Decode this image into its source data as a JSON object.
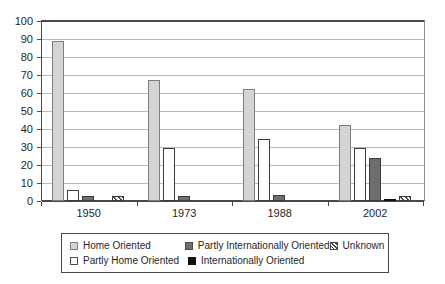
{
  "chart_data": {
    "type": "bar",
    "title": "",
    "subtitle": "",
    "xlabel": "",
    "ylabel": "",
    "categories": [
      "1950",
      "1973",
      "1988",
      "2002"
    ],
    "ylim": [
      0,
      100
    ],
    "y_ticks": [
      0,
      10,
      20,
      30,
      40,
      50,
      60,
      70,
      80,
      90,
      100
    ],
    "grid": true,
    "legend_position": "bottom",
    "series": [
      {
        "name": "Home Oriented",
        "swatch": "home",
        "color": "#d4d4d4",
        "values": [
          89,
          67.5,
          62,
          42.5
        ]
      },
      {
        "name": "Partly Home Oriented",
        "swatch": "partly-home",
        "color": "#ffffff",
        "values": [
          6,
          29.5,
          34.5,
          29.5
        ]
      },
      {
        "name": "Partly Internationally Oriented",
        "swatch": "partly-intl",
        "color": "#6e6e6e",
        "values": [
          3,
          3,
          3.2,
          24
        ]
      },
      {
        "name": "Internationally Oriented",
        "swatch": "intl",
        "color": "#111111",
        "values": [
          0,
          0,
          0,
          1.3
        ]
      },
      {
        "name": "Unknown",
        "swatch": "unknown",
        "color": "#ffffff",
        "values": [
          3,
          0,
          0,
          2.8
        ]
      }
    ]
  },
  "legend": {
    "rows": [
      [
        {
          "label": "Home Oriented",
          "swatch": "home"
        },
        {
          "label": "Partly Internationally Oriented",
          "swatch": "partly-intl"
        },
        {
          "label": "Unknown",
          "swatch": "unknown"
        }
      ],
      [
        {
          "label": "Partly Home Oriented",
          "swatch": "partly-home"
        },
        {
          "label": "Internationally Oriented",
          "swatch": "intl"
        }
      ]
    ]
  }
}
